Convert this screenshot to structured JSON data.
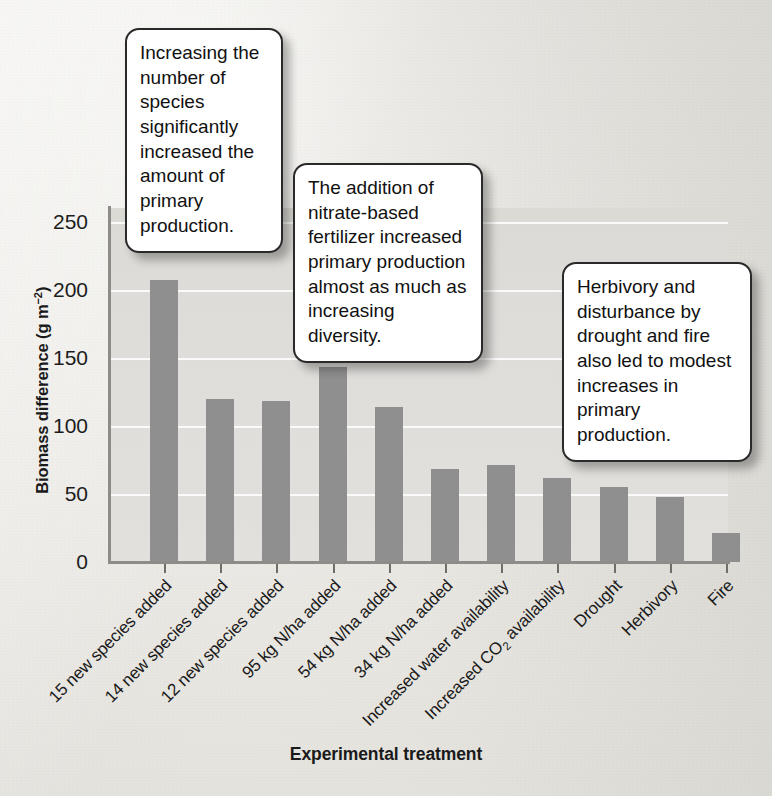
{
  "chart_data": {
    "type": "bar",
    "title": "",
    "xlabel": "Experimental treatment",
    "ylabel": "Biomass difference (g m⁻²)",
    "ylim": [
      0,
      260
    ],
    "yticks": [
      0,
      50,
      100,
      150,
      200,
      250
    ],
    "ytick_labels": [
      "0",
      "50",
      "100",
      "150",
      "200",
      "250"
    ],
    "grid": true,
    "legend": "none",
    "bar_color": "#8f8f8f",
    "plot_background": "#dedcd8",
    "categories": [
      "15 new species added",
      "14 new species added",
      "12 new species added",
      "95 kg N/ha added",
      "54 kg N/ha added",
      "34 kg N/ha added",
      "Increased water availability",
      "Increased CO₂ availability",
      "Drought",
      "Herbivory",
      "Fire"
    ],
    "category_labels_html": [
      "15 new species added",
      "14 new species added",
      "12 new species added",
      "95 kg N/ha added",
      "54 kg N/ha added",
      "34 kg N/ha added",
      "Increased water availability",
      "Increased CO<sub>2</sub> availability",
      "Drought",
      "Herbivory",
      "Fire"
    ],
    "values": [
      207,
      120,
      118,
      143,
      114,
      68,
      71,
      62,
      55,
      48,
      21
    ]
  },
  "axis": {
    "y_title": "Biomass difference (g m",
    "y_title_sup": "−2",
    "y_title_close": ")",
    "x_title": "Experimental treatment"
  },
  "callouts": [
    {
      "id": "callout-1",
      "text": "Increasing the number of species significantly increased the amount of primary production."
    },
    {
      "id": "callout-2",
      "text": "The addition of nitrate-based fertilizer increased primary production almost as much as increasing diversity."
    },
    {
      "id": "callout-3",
      "text": "Herbivory and disturbance by drought and fire also led to modest increases in primary production."
    }
  ]
}
